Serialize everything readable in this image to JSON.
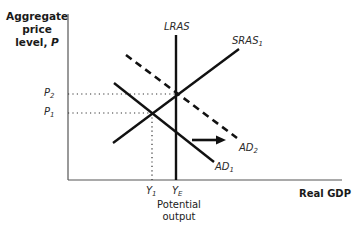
{
  "diagram": {
    "type": "AD-AS model",
    "y_axis_label_line1": "Aggregate",
    "y_axis_label_line2": "price",
    "y_axis_label_line3": "level, ",
    "y_axis_label_var": "P",
    "x_axis_label": "Real GDP",
    "curves": {
      "lras": "LRAS",
      "sras_base": "SRAS",
      "sras_sub": "1",
      "ad1_base": "AD",
      "ad1_sub": "1",
      "ad2_base": "AD",
      "ad2_sub": "2"
    },
    "price_ticks": {
      "p2_base": "P",
      "p2_sub": "2",
      "p1_base": "P",
      "p1_sub": "1"
    },
    "output_ticks": {
      "y1_base": "Y",
      "y1_sub": "1",
      "ye_base": "Y",
      "ye_sub": "E"
    },
    "potential_output_line1": "Potential",
    "potential_output_line2": "output",
    "annotations": [
      "Rightward shift arrow from AD1 to AD2"
    ]
  }
}
